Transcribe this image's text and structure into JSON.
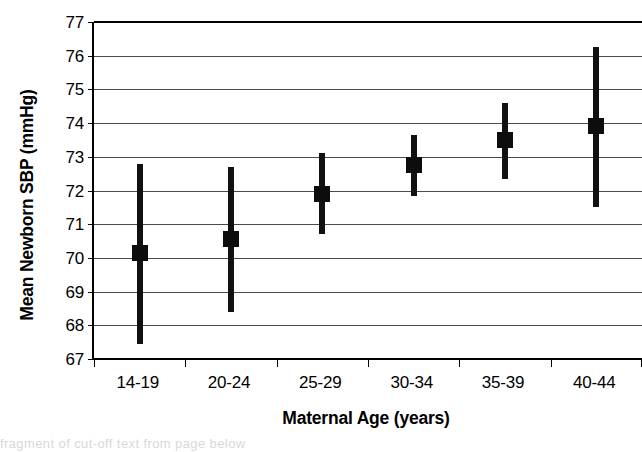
{
  "chart_data": {
    "type": "scatter",
    "title": "",
    "xlabel": "Maternal Age (years)",
    "ylabel": "Mean Newborn SBP (mmHg)",
    "categories": [
      "14-19",
      "20-24",
      "25-29",
      "30-34",
      "35-39",
      "40-44"
    ],
    "values": [
      70.15,
      70.55,
      71.9,
      72.75,
      73.5,
      73.9
    ],
    "error_low": [
      67.45,
      68.4,
      70.7,
      71.85,
      72.35,
      71.5
    ],
    "error_high": [
      72.8,
      72.7,
      73.1,
      73.65,
      74.6,
      76.25
    ],
    "ylim": [
      67,
      77
    ],
    "y_ticks": [
      67,
      68,
      69,
      70,
      71,
      72,
      73,
      74,
      75,
      76,
      77
    ],
    "y_tick_labels": [
      "67",
      "68",
      "69",
      "70",
      "71",
      "72",
      "73",
      "74",
      "75",
      "76",
      "77"
    ],
    "grid": true,
    "grid_axis": "y",
    "legend": false,
    "legend_position": "none",
    "marker": "square",
    "marker_color": "#0d0d0d",
    "error_bar_color": "#111111",
    "gridline_color": "#4a4a4a",
    "axis_color": "#000000",
    "background_color": "#ffffff",
    "series": [
      {
        "name": "Mean Newborn SBP",
        "points": [
          {
            "category": "14-19",
            "mean": 70.15,
            "low": 67.45,
            "high": 72.8
          },
          {
            "category": "20-24",
            "mean": 70.55,
            "low": 68.4,
            "high": 72.7
          },
          {
            "category": "25-29",
            "mean": 71.9,
            "low": 70.7,
            "high": 73.1
          },
          {
            "category": "30-34",
            "mean": 72.75,
            "low": 71.85,
            "high": 73.65
          },
          {
            "category": "35-39",
            "mean": 73.5,
            "low": 72.35,
            "high": 74.6
          },
          {
            "category": "40-44",
            "mean": 73.9,
            "low": 71.5,
            "high": 76.25
          }
        ]
      }
    ],
    "annotations": []
  },
  "scan_artifact": {
    "text": "        fragment of cut-off text from page below"
  }
}
